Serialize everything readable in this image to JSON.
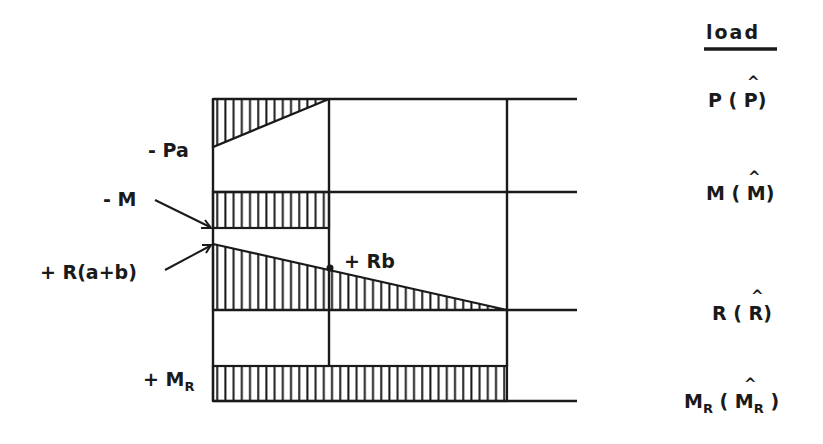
{
  "legend": {
    "header": "load",
    "rows": [
      {
        "id": "P",
        "base": "P",
        "hat": "P",
        "sub": ""
      },
      {
        "id": "M",
        "base": "M",
        "hat": "M",
        "sub": ""
      },
      {
        "id": "R",
        "base": "R",
        "hat": "R",
        "sub": ""
      },
      {
        "id": "MR",
        "base": "M",
        "hat": "M",
        "sub": "R"
      }
    ]
  },
  "annotations": {
    "minus_pa": "- Pa",
    "minus_m": "- M",
    "plus_r_ab": "+ R(a+b)",
    "plus_rb": "+ Rb",
    "plus_mr_sign": "+ M",
    "plus_mr_sub": "R"
  },
  "colors": {
    "ink": "#1a1a1a",
    "paper": "#ffffff"
  },
  "geometry": {
    "x_left": 213,
    "x_mid": 329,
    "x_right": 507,
    "x_end": 577,
    "rows": [
      {
        "load": "P",
        "baseline_y": 99,
        "shape": "triangle from -Pa at left to 0 at mid"
      },
      {
        "load": "M",
        "baseline_y": 192,
        "shape": "constant -M from left to mid",
        "depth_y": 228
      },
      {
        "load": "R",
        "baseline_y": 310,
        "shape": "linear from +R(a+b) at left to 0 at right, +Rb at mid",
        "left_y": 244,
        "mid_y": 268
      },
      {
        "load": "MR",
        "baseline_y": 401,
        "shape": "constant +MR from left to right",
        "top_y": 366
      }
    ]
  }
}
